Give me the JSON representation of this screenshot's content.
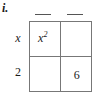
{
  "problem": {
    "label": "i.",
    "type": "area-model-box-method",
    "description": "2 by 2 box method grid for factoring a quadratic"
  },
  "blanks": [
    {
      "name": "column-1-blank",
      "value": ""
    },
    {
      "name": "column-2-blank",
      "value": ""
    }
  ],
  "row_labels": [
    {
      "text": "x",
      "italic": true
    },
    {
      "text": "2",
      "italic": false
    }
  ],
  "grid": {
    "rows": 2,
    "cols": 2,
    "cells": [
      [
        {
          "base": "x",
          "exponent": "2",
          "italic": true,
          "empty": false
        },
        {
          "base": "",
          "exponent": "",
          "italic": false,
          "empty": true
        }
      ],
      [
        {
          "base": "",
          "exponent": "",
          "italic": false,
          "empty": true
        },
        {
          "base": "6",
          "exponent": "",
          "italic": false,
          "empty": false
        }
      ]
    ]
  },
  "colors": {
    "ink": "#1a1a1a",
    "grid_line": "#777777",
    "blank_line": "#555555",
    "background": "#ffffff"
  }
}
